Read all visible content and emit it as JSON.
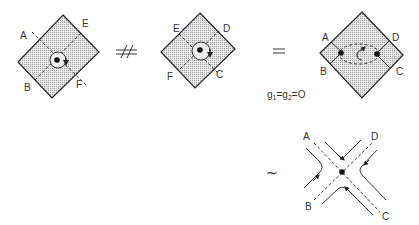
{
  "figure": {
    "panel1": {
      "labels": {
        "A": "A",
        "E": "E",
        "B": "B",
        "F": "F"
      }
    },
    "not_equivalent_symbol": "≉",
    "panel2": {
      "labels": {
        "E": "E",
        "D": "D",
        "F": "F",
        "C": "C"
      }
    },
    "equals_symbol": "=",
    "condition": "g₁ = g₂ = 0",
    "condition_parts": {
      "g1": "g",
      "sub1": "1",
      "eq1": "=",
      "g2": "g",
      "sub2": "2",
      "eq2": "=",
      "zero": "O"
    },
    "panel3": {
      "labels": {
        "A": "A",
        "D": "D",
        "B": "B",
        "C": "C"
      }
    },
    "similar_symbol": "~",
    "panel4": {
      "labels": {
        "A": "A",
        "D": "D",
        "B": "B",
        "C": "C"
      }
    }
  }
}
